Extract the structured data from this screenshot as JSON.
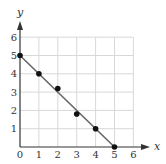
{
  "chart_data": {
    "type": "scatter",
    "title": "",
    "xlabel": "x",
    "ylabel": "y",
    "xlim": [
      0,
      6
    ],
    "ylim": [
      0,
      6
    ],
    "grid": true,
    "x_ticks": [
      "0",
      "1",
      "2",
      "3",
      "4",
      "5",
      "6"
    ],
    "y_ticks": [
      "1",
      "2",
      "3",
      "4",
      "5",
      "6"
    ],
    "series": [
      {
        "name": "data points",
        "type": "scatter",
        "x": [
          0,
          1,
          2,
          3,
          4,
          5
        ],
        "y": [
          5,
          4,
          3.2,
          1.8,
          1,
          0
        ]
      },
      {
        "name": "fitted line",
        "type": "line",
        "x": [
          0,
          5
        ],
        "y": [
          5,
          0
        ],
        "equation": "y = 5 - x"
      }
    ],
    "colors": {
      "points": "#111111",
      "line": "#666666",
      "grid": "#d8d8d8",
      "axes": "#333333"
    }
  }
}
